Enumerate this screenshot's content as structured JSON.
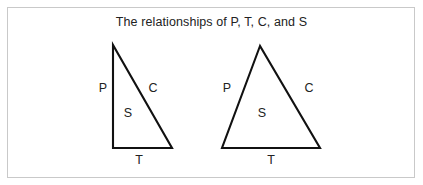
{
  "figure": {
    "title": "The relationships of P, T, C, and S",
    "background_color": "#ffffff",
    "frame_color": "#c9c9c9",
    "stroke_color": "#111111",
    "text_color": "#222222"
  },
  "diagram_data": {
    "type": "diagram",
    "description": "Two outlined triangles illustrating the relationships of P, T, C, and S. Each triangle has its left side labeled P, its right side labeled C, its base labeled T, and its interior area labeled S.",
    "shapes": [
      {
        "id": "left-triangle",
        "name": "right-triangle",
        "vertices": [
          [
            113,
            45
          ],
          [
            113,
            148
          ],
          [
            172,
            148
          ]
        ],
        "labels": {
          "left_side": "P",
          "right_side": "C",
          "base": "T",
          "interior": "S"
        }
      },
      {
        "id": "right-triangle",
        "name": "isosceles-triangle",
        "vertices": [
          [
            260,
            46
          ],
          [
            222,
            148
          ],
          [
            320,
            148
          ]
        ],
        "labels": {
          "left_side": "P",
          "right_side": "C",
          "base": "T",
          "interior": "S"
        }
      }
    ],
    "legend_keys": [
      {
        "key": "P",
        "role": "left side"
      },
      {
        "key": "C",
        "role": "right side"
      },
      {
        "key": "T",
        "role": "base"
      },
      {
        "key": "S",
        "role": "interior area"
      }
    ]
  },
  "left_triangle_labels": {
    "p": "P",
    "c": "C",
    "s": "S",
    "t": "T"
  },
  "right_triangle_labels": {
    "p": "P",
    "c": "C",
    "s": "S",
    "t": "T"
  }
}
